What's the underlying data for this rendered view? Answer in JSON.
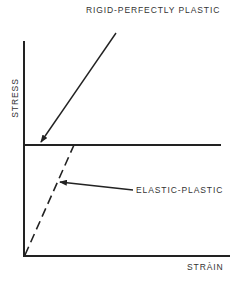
{
  "diagram": {
    "title": "RIGID-PERFECTLY PLASTIC",
    "axes": {
      "y_label": "STRESS",
      "x_label": "STRÀIN"
    },
    "curves": [
      {
        "name": "rigid-perfectly-plastic",
        "style": "solid",
        "description": "Vertical rise at zero strain then horizontal at yield stress"
      },
      {
        "name": "elastic-plastic",
        "style": "dashed",
        "description": "Linear elastic slope from origin up to yield stress, then horizontal"
      }
    ],
    "annotations": [
      {
        "text": "RIGID-PERFECTLY PLASTIC",
        "points_to": "yield line near stress axis"
      },
      {
        "text": "ELASTIC-PLASTIC",
        "points_to": "dashed elastic slope"
      }
    ],
    "elastic_label": "ELASTIC-PLASTIC",
    "colors": {
      "line": "#222222",
      "text": "#333333",
      "background": "#ffffff"
    }
  }
}
